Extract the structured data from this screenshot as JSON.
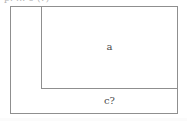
{
  "figure": {
    "caption_clipped": "p. ... e (?)",
    "background_color": "#ffffff",
    "stroke_color": "#8f8f8f",
    "label_color": "#4a4a4a"
  },
  "shapes": {
    "outer_rectangle": {
      "name": "outer rectangle",
      "x": 10,
      "y": 6,
      "width": 168,
      "height": 108
    },
    "inner_rectangle": {
      "name": "inner rectangle",
      "x": 41,
      "y": 6,
      "width": 137,
      "height": 83
    }
  },
  "labels": {
    "region_a": "a",
    "region_c": "c?"
  }
}
